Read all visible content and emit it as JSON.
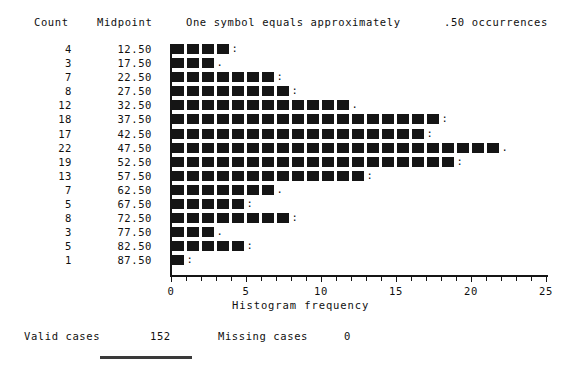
{
  "header": {
    "count_label": "Count",
    "midpoint_label": "Midpoint",
    "symbol_note": "One symbol equals approximately",
    "occurrences_note": ".50 occurrences"
  },
  "footer": {
    "valid_cases_label": "Valid cases",
    "valid_cases_value": "152",
    "missing_cases_label": "Missing cases",
    "missing_cases_value": "0"
  },
  "axis": {
    "title": "Histogram frequency",
    "tick_labels": [
      "0",
      "5",
      "10",
      "15",
      "20",
      "25"
    ],
    "tick_values": [
      0,
      5,
      10,
      15,
      20,
      25
    ],
    "min": 0,
    "max": 25,
    "minor_tick_step": 1
  },
  "rows": [
    {
      "count": "4",
      "midpoint": "12.50"
    },
    {
      "count": "3",
      "midpoint": "17.50"
    },
    {
      "count": "7",
      "midpoint": "22.50"
    },
    {
      "count": "8",
      "midpoint": "27.50"
    },
    {
      "count": "12",
      "midpoint": "32.50"
    },
    {
      "count": "18",
      "midpoint": "37.50"
    },
    {
      "count": "17",
      "midpoint": "42.50"
    },
    {
      "count": "22",
      "midpoint": "47.50"
    },
    {
      "count": "19",
      "midpoint": "52.50"
    },
    {
      "count": "13",
      "midpoint": "57.50"
    },
    {
      "count": "7",
      "midpoint": "62.50"
    },
    {
      "count": "5",
      "midpoint": "67.50"
    },
    {
      "count": "8",
      "midpoint": "72.50"
    },
    {
      "count": "3",
      "midpoint": "77.50"
    },
    {
      "count": "5",
      "midpoint": "82.50"
    },
    {
      "count": "1",
      "midpoint": "87.50"
    }
  ],
  "chart_data": {
    "type": "bar",
    "title": "",
    "orientation": "horizontal",
    "xlabel": "Histogram frequency",
    "ylabel": "Midpoint",
    "xlim": [
      0,
      25
    ],
    "grid": false,
    "legend": "none",
    "symbol_scale": 0.5,
    "categories": [
      "12.50",
      "17.50",
      "22.50",
      "27.50",
      "32.50",
      "37.50",
      "42.50",
      "47.50",
      "52.50",
      "57.50",
      "62.50",
      "67.50",
      "72.50",
      "77.50",
      "82.50",
      "87.50"
    ],
    "values": [
      4,
      3,
      7,
      8,
      12,
      18,
      17,
      22,
      19,
      13,
      7,
      5,
      8,
      3,
      5,
      1
    ],
    "total_valid": 152,
    "total_missing": 0
  }
}
